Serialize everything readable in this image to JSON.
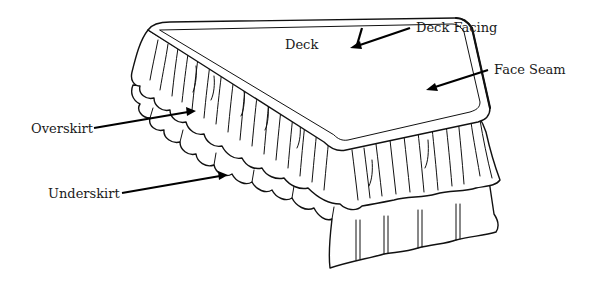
{
  "figure": {
    "labels": {
      "deck": "Deck",
      "deck_facing": "Deck Facing",
      "face_seam": "Face Seam",
      "overskirt": "Overskirt",
      "underskirt": "Underskirt"
    }
  },
  "colors": {
    "ink": "#111111",
    "background": "#ffffff"
  }
}
